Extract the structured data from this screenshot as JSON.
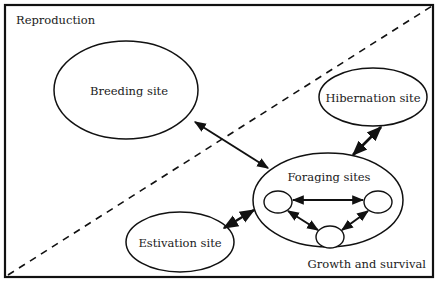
{
  "diagram": {
    "regions": {
      "top_left": "Reproduction",
      "bottom_right": "Growth and survival"
    },
    "nodes": {
      "breeding": "Breeding site",
      "hibernation": "Hibernation site",
      "foraging": "Foraging sites",
      "estivation": "Estivation site"
    },
    "connections": [
      {
        "from": "Breeding site",
        "to": "Foraging sites",
        "type": "bidirectional"
      },
      {
        "from": "Hibernation site",
        "to": "Foraging sites",
        "type": "bidirectional"
      },
      {
        "from": "Estivation site",
        "to": "Foraging sites",
        "type": "bidirectional"
      },
      {
        "from": "foraging-subsite-left",
        "to": "foraging-subsite-right",
        "type": "bidirectional"
      },
      {
        "from": "foraging-subsite-left",
        "to": "foraging-subsite-bottom",
        "type": "bidirectional"
      },
      {
        "from": "foraging-subsite-right",
        "to": "foraging-subsite-bottom",
        "type": "bidirectional"
      }
    ],
    "divider": "dashed diagonal line"
  }
}
